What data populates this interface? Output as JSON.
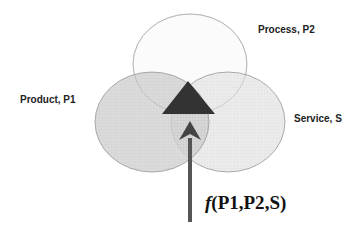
{
  "diagram": {
    "sets": [
      {
        "id": "process",
        "label": "Process, P2",
        "fill": "#fbfbfb"
      },
      {
        "id": "product",
        "label": "Product, P1",
        "fill": "#d6d6d6"
      },
      {
        "id": "service",
        "label": "Service, S",
        "fill": "#e9e9e9"
      }
    ],
    "intersection_marker": {
      "shape": "triangle",
      "color": "#333333"
    },
    "arrow": {
      "color": "#555555"
    },
    "formula": {
      "func": "f",
      "open": "(",
      "arg1": "P1",
      "sep1": ",",
      "arg2": "P2",
      "sep2": ",",
      "arg3": "S",
      "close": ")"
    }
  }
}
